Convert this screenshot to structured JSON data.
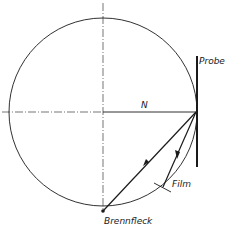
{
  "diagram": {
    "type": "focusing-circle-geometry",
    "labels": {
      "probe": "Probe",
      "normal": "N",
      "film": "Film",
      "focal_spot": "Brennfleck"
    },
    "colors": {
      "line": "#1a1a1a",
      "background": "#ffffff"
    }
  }
}
